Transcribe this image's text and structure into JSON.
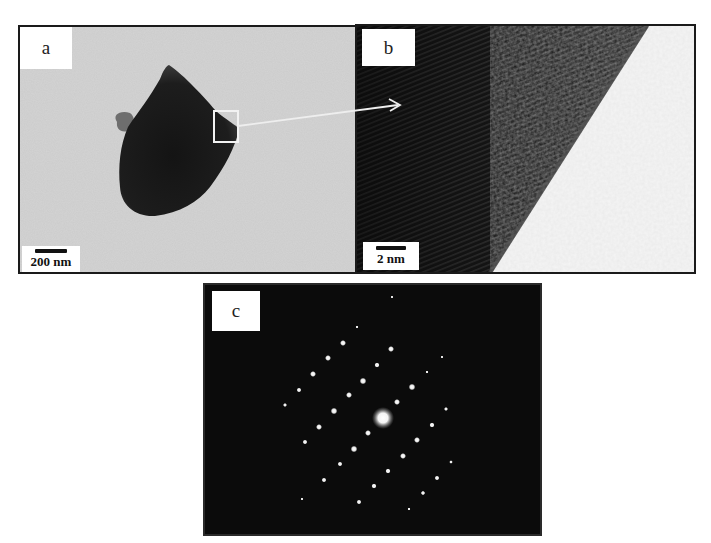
{
  "figure": {
    "panels": [
      {
        "id": "a",
        "label": "a",
        "scale_bar": "200 nm",
        "description": "low-magnification TEM image of a single dark particle with a selected region box"
      },
      {
        "id": "b",
        "label": "b",
        "scale_bar": "2 nm",
        "description": "HRTEM image showing lattice fringes at particle edge"
      },
      {
        "id": "c",
        "label": "c",
        "description": "selected area electron diffraction pattern with spot array"
      }
    ],
    "colors": {
      "panel_a_background": "#c9c9c9",
      "particle": "#1c1c1c",
      "panel_b_dark": "#1e1e1e",
      "panel_b_light": "#f4f4f4",
      "diffraction_background": "#0b0b0b",
      "diffraction_spot": "#f2f2f2",
      "annotation": "#ffffff"
    }
  }
}
